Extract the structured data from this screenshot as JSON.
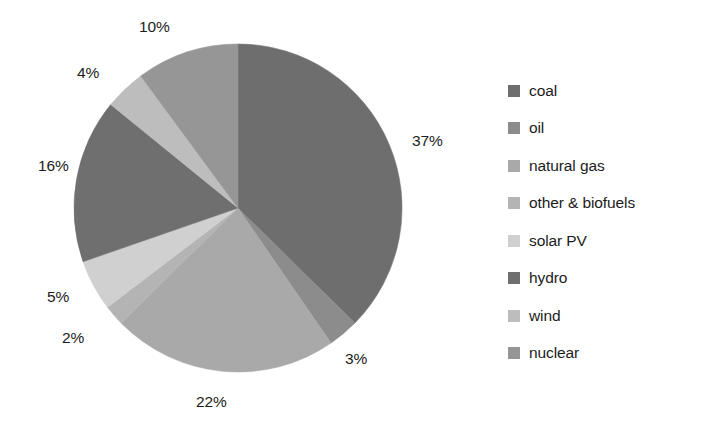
{
  "chart_data": {
    "type": "pie",
    "title": "",
    "categories": [
      "coal",
      "oil",
      "natural gas",
      "other & biofuels",
      "solar PV",
      "hydro",
      "wind",
      "nuclear"
    ],
    "values": [
      37,
      3,
      22,
      2,
      5,
      16,
      4,
      10
    ],
    "value_unit": "%",
    "data_labels": [
      "37%",
      "3%",
      "22%",
      "2%",
      "5%",
      "16%",
      "4%",
      "10%"
    ],
    "colors": [
      "#6e6e6e",
      "#8c8c8c",
      "#a9a9a9",
      "#b4b4b4",
      "#d0d0d0",
      "#6f6f6f",
      "#bdbdbd",
      "#969696"
    ],
    "start_angle_deg": 0,
    "direction": "clockwise",
    "legend_position": "right",
    "grid": false,
    "xlabel": "",
    "ylabel": ""
  },
  "pie": {
    "center_x": 238,
    "center_y": 208,
    "radius": 164,
    "slices": [
      {
        "name": "coal",
        "label": "37%",
        "value": 37,
        "color": "#6e6e6e",
        "label_x": 412,
        "label_y": 132
      },
      {
        "name": "oil",
        "label": "3%",
        "value": 3,
        "color": "#8c8c8c",
        "label_x": 345,
        "label_y": 350
      },
      {
        "name": "natural-gas",
        "label": "22%",
        "value": 22,
        "color": "#a9a9a9",
        "label_x": 196,
        "label_y": 393
      },
      {
        "name": "other-biofuels",
        "label": "2%",
        "value": 2,
        "color": "#b4b4b4",
        "label_x": 62,
        "label_y": 329
      },
      {
        "name": "solar-pv",
        "label": "5%",
        "value": 5,
        "color": "#d0d0d0",
        "label_x": 47,
        "label_y": 288
      },
      {
        "name": "hydro",
        "label": "16%",
        "value": 16,
        "color": "#6f6f6f",
        "label_x": 38,
        "label_y": 157
      },
      {
        "name": "wind",
        "label": "4%",
        "value": 4,
        "color": "#bdbdbd",
        "label_x": 77,
        "label_y": 64
      },
      {
        "name": "nuclear",
        "label": "10%",
        "value": 10,
        "color": "#969696",
        "label_x": 139,
        "label_y": 18
      }
    ]
  },
  "legend": {
    "items": [
      {
        "label": "coal",
        "color": "#6e6e6e"
      },
      {
        "label": "oil",
        "color": "#8c8c8c"
      },
      {
        "label": "natural gas",
        "color": "#a9a9a9"
      },
      {
        "label": "other & biofuels",
        "color": "#b4b4b4"
      },
      {
        "label": "solar PV",
        "color": "#d0d0d0"
      },
      {
        "label": "hydro",
        "color": "#6f6f6f"
      },
      {
        "label": "wind",
        "color": "#bdbdbd"
      },
      {
        "label": "nuclear",
        "color": "#969696"
      }
    ]
  }
}
